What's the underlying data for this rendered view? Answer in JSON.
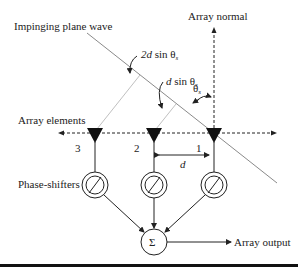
{
  "labels": {
    "impinging_wave": "Impinging plane wave",
    "array_normal": "Array normal",
    "array_elements": "Array elements",
    "phase_shifters": "Phase-shifters",
    "array_output": "Array output",
    "two_d_sin_d": "2d",
    "two_d_sin_rest": " sin θ",
    "d_sin_d": "d",
    "d_sin_rest": " sin θ",
    "theta": "θ",
    "sub_s": "s",
    "spacing_d": "d",
    "sum_symbol": "Σ",
    "phase_symbol": "∅"
  },
  "elements": [
    {
      "index": "3",
      "x": 95
    },
    {
      "index": "2",
      "x": 154
    },
    {
      "index": "1",
      "x": 214
    }
  ],
  "colors": {
    "line": "#222222",
    "wave": "#888888",
    "projection": "#bbbbbb"
  }
}
